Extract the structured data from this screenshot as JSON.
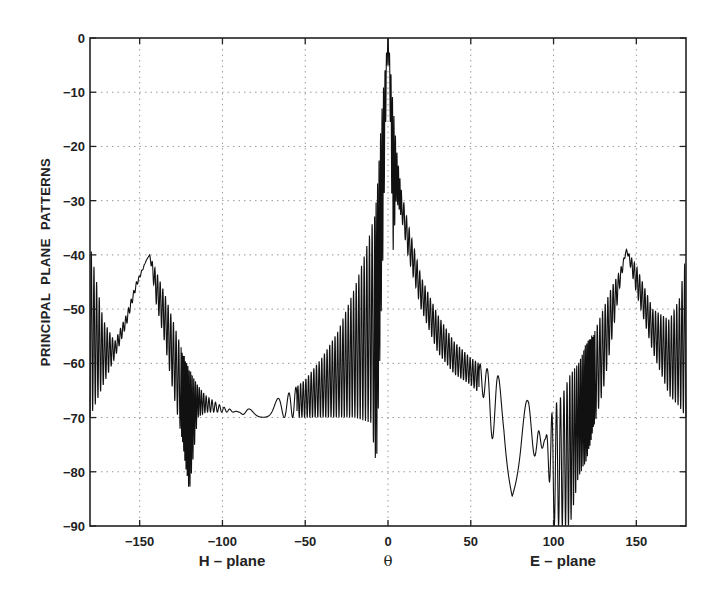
{
  "chart_data": {
    "type": "line",
    "title": "",
    "xlabel": "θ",
    "xlabel_left": "H – plane",
    "xlabel_right": "E – plane",
    "ylabel": "PRINCIPAL  PLANE  PATTERNS",
    "xlim": [
      -180,
      180
    ],
    "ylim": [
      -90,
      0
    ],
    "grid": true,
    "grid_style": "dotted",
    "legend": null,
    "x_ticks": [
      -150,
      -100,
      -50,
      0,
      50,
      100,
      150
    ],
    "x_tick_labels": [
      "−150",
      "−100",
      "−50",
      "0",
      "50",
      "100",
      "150"
    ],
    "y_ticks": [
      0,
      -10,
      -20,
      -30,
      -40,
      -50,
      -60,
      -70,
      -80,
      -90
    ],
    "y_tick_labels": [
      "0",
      "−10",
      "−20",
      "−30",
      "−40",
      "−50",
      "−60",
      "−70",
      "−80",
      "−90"
    ],
    "series": [
      {
        "name": "H-plane pattern (θ < 0)",
        "description": "Rapidly oscillating pattern; values give upper envelope (max) and lower envelope (min) in dB",
        "x": [
          -180,
          -172,
          -165,
          -158,
          -152,
          -146,
          -144,
          -140,
          -135,
          -130,
          -125,
          -120,
          -115,
          -110,
          -100,
          -90,
          -85,
          -80,
          -70,
          -60,
          -50,
          -40,
          -30,
          -20,
          -15,
          -10,
          -7,
          -5,
          -3,
          -1,
          0
        ],
        "max": [
          -38,
          -52,
          -56,
          -51,
          -45,
          -41,
          -40,
          -43,
          -47,
          -52,
          -57,
          -61,
          -64,
          -66,
          -68,
          -69,
          -68.5,
          -68,
          -67,
          -65.5,
          -63,
          -59,
          -54,
          -46,
          -41,
          -35,
          -30,
          -20,
          -10,
          -3,
          0
        ],
        "min": [
          -70,
          -64,
          -59,
          -53,
          -46,
          -41,
          -40,
          -49,
          -56,
          -65,
          -73,
          -84,
          -70,
          -69,
          -69,
          -69,
          -70,
          -70,
          -70,
          -70,
          -70,
          -70,
          -70,
          -70,
          -70.5,
          -71,
          -80,
          -60,
          -40,
          -10,
          0
        ]
      },
      {
        "name": "E-plane pattern (θ > 0)",
        "description": "Rapidly oscillating pattern; values give upper envelope (max) and lower envelope (min) in dB",
        "x": [
          0,
          1,
          3,
          5,
          8,
          12,
          20,
          30,
          40,
          50,
          60,
          65,
          70,
          75,
          80,
          85,
          90,
          95,
          100,
          105,
          110,
          115,
          120,
          125,
          130,
          135,
          140,
          144,
          150,
          160,
          170,
          176,
          180
        ],
        "max": [
          0,
          -3,
          -12,
          -20,
          -28,
          -34,
          -44,
          -51,
          -56,
          -59,
          -61,
          -62,
          -63,
          -65,
          -66,
          -67,
          -72,
          -74,
          -68,
          -66,
          -62,
          -60,
          -56,
          -54,
          -50,
          -46,
          -43,
          -39,
          -42,
          -50,
          -52,
          -48,
          -40
        ],
        "min": [
          0,
          -10,
          -40,
          -30,
          -33,
          -40,
          -50,
          -58,
          -62,
          -64,
          -67,
          -79,
          -78,
          -85,
          -80,
          -73,
          -79,
          -74,
          -90,
          -90,
          -90,
          -81,
          -78,
          -71,
          -65,
          -56,
          -46,
          -39,
          -47,
          -58,
          -66,
          -68,
          -70
        ]
      }
    ],
    "peaks": [
      {
        "x": 0,
        "y": 0,
        "label": "main beam"
      },
      {
        "x": -144,
        "y": -40,
        "label": "H-plane back lobe"
      },
      {
        "x": 144,
        "y": -39.5,
        "label": "E-plane back lobe"
      }
    ]
  }
}
